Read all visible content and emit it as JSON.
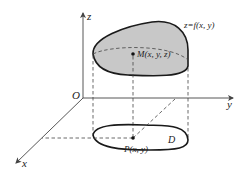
{
  "diagram": {
    "axes": {
      "z_label": "z",
      "y_label": "y",
      "x_label": "x",
      "origin_label": "O"
    },
    "surface": {
      "equation_label": "z=f(x, y)",
      "fill_color": "#c8c8c8",
      "point_label": "M(x, y, z)"
    },
    "region": {
      "label": "D",
      "fill_color": "#ffffff",
      "point_label": "P(x, y)"
    },
    "colors": {
      "stroke": "#1a1a1a",
      "axis": "#444444",
      "background": "#ffffff"
    }
  }
}
